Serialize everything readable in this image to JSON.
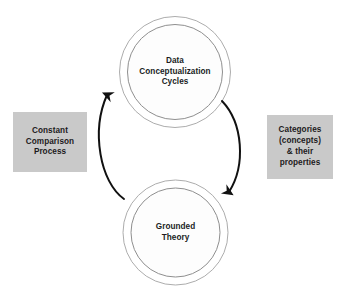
{
  "diagram": {
    "type": "cyclical-process-diagram",
    "background_color": "#ffffff",
    "nodes": [
      {
        "id": "data-conceptualization-cycles",
        "label": "Data\nConceptualization\nCycles",
        "shape": "concentric-circles",
        "position": "top",
        "fill_color": "#ffffff",
        "stroke_color": "#9a9a9a"
      },
      {
        "id": "grounded-theory",
        "label": "Grounded\nTheory",
        "shape": "concentric-circles",
        "position": "bottom",
        "fill_color": "#ffffff",
        "stroke_color": "#9a9a9a"
      }
    ],
    "captions": [
      {
        "id": "constant-comparison-process",
        "label": "Constant\nComparison\nProcess",
        "position": "left",
        "fill_color": "#c9c9c9",
        "text_color": "#1d1b1c"
      },
      {
        "id": "categories-concepts-properties",
        "label": "Categories\n(concepts)\n& their\nproperties",
        "position": "right",
        "fill_color": "#c9c9c9",
        "text_color": "#1d1b1c"
      }
    ],
    "arrows": [
      {
        "id": "arrow-bottom-to-top",
        "from": "grounded-theory",
        "to": "data-conceptualization-cycles",
        "side": "left",
        "direction": "upward",
        "color": "#111111"
      },
      {
        "id": "arrow-top-to-bottom",
        "from": "data-conceptualization-cycles",
        "to": "grounded-theory",
        "side": "right",
        "direction": "downward",
        "color": "#111111"
      }
    ]
  }
}
